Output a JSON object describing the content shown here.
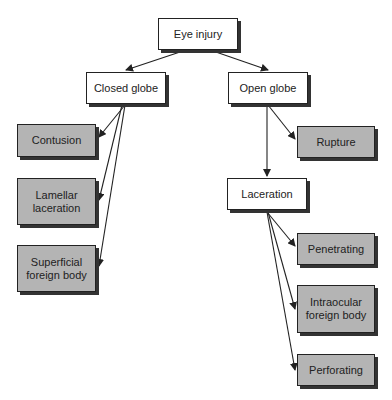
{
  "diagram": {
    "root": {
      "label": "Eye injury"
    },
    "closed_globe": {
      "label": "Closed globe",
      "children": [
        "Contusion",
        "Lamellar laceration",
        "Superficial foreign body"
      ]
    },
    "open_globe": {
      "label": "Open globe",
      "children": [
        "Rupture",
        "Laceration"
      ]
    },
    "laceration": {
      "label": "Laceration",
      "children": [
        "Penetrating",
        "Intraocular foreign body",
        "Perforating"
      ]
    },
    "nodes": {
      "eye_injury": "Eye injury",
      "closed_globe": "Closed globe",
      "open_globe": "Open globe",
      "contusion": "Contusion",
      "lamellar_laceration": "Lamellar laceration",
      "superficial_foreign_body": "Superficial foreign body",
      "rupture": "Rupture",
      "laceration": "Laceration",
      "penetrating": "Penetrating",
      "intraocular_foreign_body": "Intraocular foreign body",
      "perforating": "Perforating"
    },
    "colors": {
      "category_fill": "#ffffff",
      "leaf_fill": "#b4b4b4",
      "stroke": "#222222"
    }
  }
}
